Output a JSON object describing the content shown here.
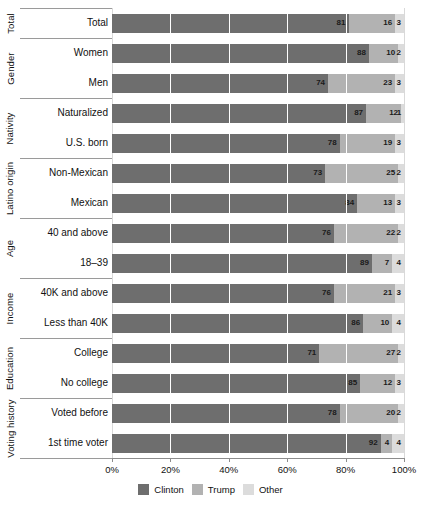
{
  "chart_data": {
    "type": "bar",
    "orientation": "horizontal",
    "stacked": true,
    "title": "",
    "xlabel": "",
    "ylabel": "",
    "xlim": [
      0,
      100
    ],
    "xticks": [
      "0%",
      "20%",
      "40%",
      "60%",
      "80%",
      "100%"
    ],
    "xtick_values": [
      0,
      20,
      40,
      60,
      80,
      100
    ],
    "grid": true,
    "legend_position": "bottom",
    "series": [
      {
        "name": "Clinton",
        "color": "#6e6e6e",
        "values": [
          81,
          88,
          74,
          87,
          78,
          73,
          84,
          76,
          89,
          76,
          86,
          71,
          85,
          78,
          92
        ]
      },
      {
        "name": "Trump",
        "color": "#b2b2b2",
        "values": [
          16,
          10,
          23,
          12,
          19,
          25,
          13,
          22,
          7,
          21,
          10,
          27,
          12,
          20,
          4
        ]
      },
      {
        "name": "Other",
        "color": "#dcdcdc",
        "values": [
          3,
          2,
          3,
          1,
          3,
          2,
          3,
          2,
          4,
          3,
          4,
          2,
          3,
          2,
          4
        ]
      }
    ],
    "categories": [
      "Total",
      "Women",
      "Men",
      "Naturalized",
      "U.S. born",
      "Non-Mexican",
      "Mexican",
      "40 and above",
      "18–39",
      "40K and above",
      "Less than 40K",
      "College",
      "No college",
      "Voted before",
      "1st time voter"
    ],
    "groups": [
      {
        "label": "Total",
        "categories": [
          "Total"
        ]
      },
      {
        "label": "Gender",
        "categories": [
          "Women",
          "Men"
        ]
      },
      {
        "label": "Nativity",
        "categories": [
          "Naturalized",
          "U.S. born"
        ]
      },
      {
        "label": "Latino origin",
        "categories": [
          "Non-Mexican",
          "Mexican"
        ]
      },
      {
        "label": "Age",
        "categories": [
          "40 and above",
          "18–39"
        ]
      },
      {
        "label": "Income",
        "categories": [
          "40K and above",
          "Less than 40K"
        ]
      },
      {
        "label": "Education",
        "categories": [
          "College",
          "No college"
        ]
      },
      {
        "label": "Voting history",
        "categories": [
          "Voted before",
          "1st time voter"
        ]
      }
    ],
    "rows": [
      {
        "group": "Total",
        "category": "Total",
        "Clinton": 81,
        "Trump": 16,
        "Other": 3
      },
      {
        "group": "Gender",
        "category": "Women",
        "Clinton": 88,
        "Trump": 10,
        "Other": 2
      },
      {
        "group": "Gender",
        "category": "Men",
        "Clinton": 74,
        "Trump": 23,
        "Other": 3
      },
      {
        "group": "Nativity",
        "category": "Naturalized",
        "Clinton": 87,
        "Trump": 12,
        "Other": 1
      },
      {
        "group": "Nativity",
        "category": "U.S. born",
        "Clinton": 78,
        "Trump": 19,
        "Other": 3
      },
      {
        "group": "Latino origin",
        "category": "Non-Mexican",
        "Clinton": 73,
        "Trump": 25,
        "Other": 2
      },
      {
        "group": "Latino origin",
        "category": "Mexican",
        "Clinton": 84,
        "Trump": 13,
        "Other": 3
      },
      {
        "group": "Age",
        "category": "40 and above",
        "Clinton": 76,
        "Trump": 22,
        "Other": 2
      },
      {
        "group": "Age",
        "category": "18–39",
        "Clinton": 89,
        "Trump": 7,
        "Other": 4
      },
      {
        "group": "Income",
        "category": "40K and above",
        "Clinton": 76,
        "Trump": 21,
        "Other": 3
      },
      {
        "group": "Income",
        "category": "Less than 40K",
        "Clinton": 86,
        "Trump": 10,
        "Other": 4
      },
      {
        "group": "Education",
        "category": "College",
        "Clinton": 71,
        "Trump": 27,
        "Other": 2
      },
      {
        "group": "Education",
        "category": "No college",
        "Clinton": 85,
        "Trump": 12,
        "Other": 3
      },
      {
        "group": "Voting history",
        "category": "Voted before",
        "Clinton": 78,
        "Trump": 20,
        "Other": 2
      },
      {
        "group": "Voting history",
        "category": "1st time voter",
        "Clinton": 92,
        "Trump": 4,
        "Other": 4
      }
    ]
  },
  "legend": {
    "items": [
      {
        "label": "Clinton",
        "color": "#6e6e6e"
      },
      {
        "label": "Trump",
        "color": "#b2b2b2"
      },
      {
        "label": "Other",
        "color": "#dcdcdc"
      }
    ]
  },
  "colors": {
    "clinton": "#6e6e6e",
    "trump": "#b2b2b2",
    "other": "#dcdcdc",
    "axis": "#8c8c8c",
    "gridline": "#d9d9d9",
    "text": "#111111",
    "background": "#ffffff"
  }
}
